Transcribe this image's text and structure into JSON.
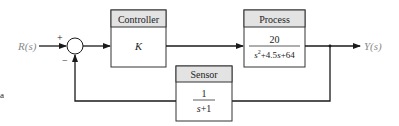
{
  "diagram": {
    "type": "feedback-control-block-diagram",
    "input": {
      "label": "R(s)"
    },
    "output": {
      "label": "Y(s)"
    },
    "summing_junction": {
      "plus_sign": "+",
      "minus_sign": "−"
    },
    "blocks": {
      "controller": {
        "title": "Controller",
        "transfer_function": "K"
      },
      "process": {
        "title": "Process",
        "numerator": "20",
        "denominator_parts": [
          "s",
          "2",
          "+4.5",
          "s",
          "+64"
        ]
      },
      "sensor": {
        "title": "Sensor",
        "numerator": "1",
        "denominator_parts": [
          "s",
          "+1"
        ]
      }
    },
    "stray_mark": "a",
    "colors": {
      "line": "#1a1a1a",
      "header_fill": "#e3e3e3",
      "box_border": "#333333",
      "signal_label": "#8a8a8a"
    }
  }
}
